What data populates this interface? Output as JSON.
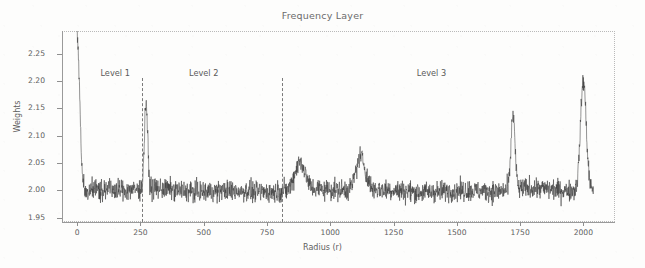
{
  "chart_data": {
    "type": "line",
    "title": "Frequency Layer",
    "xlabel": "Radius (r)",
    "ylabel": "Weights",
    "xlim": [
      -60,
      2125
    ],
    "ylim": [
      1.942,
      2.292
    ],
    "xticks": [
      0,
      250,
      500,
      750,
      1000,
      1250,
      1500,
      1750,
      2000
    ],
    "xtick_labels": [
      "0",
      "250",
      "500",
      "750",
      "1000",
      "1250",
      "1500",
      "1750",
      "2000"
    ],
    "yticks": [
      1.95,
      2.0,
      2.05,
      2.1,
      2.15,
      2.2,
      2.25
    ],
    "ytick_labels": [
      "1.95",
      "2.00",
      "2.05",
      "2.10",
      "2.15",
      "2.20",
      "2.25"
    ],
    "grid": false,
    "legend": false,
    "series_name": "weights",
    "line_color": "#3a3a3a",
    "baseline": 2.0,
    "noise_amplitude": 0.018,
    "peaks": [
      {
        "r": 0,
        "value": 2.28,
        "width": 14,
        "label": "origin-spike"
      },
      {
        "r": 272,
        "value": 2.16,
        "width": 9,
        "label": "level-1-boundary-spike"
      },
      {
        "r": 880,
        "value": 2.05,
        "width": 28,
        "label": "level-2-boundary-bump"
      },
      {
        "r": 1120,
        "value": 2.06,
        "width": 26,
        "label": "mid-bump"
      },
      {
        "r": 1722,
        "value": 2.14,
        "width": 11,
        "label": "level-3-spike"
      },
      {
        "r": 2000,
        "value": 2.2,
        "width": 16,
        "label": "edge-spike"
      }
    ],
    "dividers": [
      {
        "name": "divider-level-1-2",
        "r": 255
      },
      {
        "name": "divider-level-2-3",
        "r": 810
      }
    ],
    "annotations": [
      {
        "name": "level-1",
        "text": "Level 1",
        "r": 150,
        "value": 2.215
      },
      {
        "name": "level-2",
        "text": "Level 2",
        "r": 500,
        "value": 2.215
      },
      {
        "name": "level-3",
        "text": "Level 3",
        "r": 1400,
        "value": 2.215
      }
    ]
  },
  "colors": {
    "line": "#3a3a3a",
    "axis": "#9a9a9a",
    "text": "#5e5e5e",
    "frame": "#b9b9b9",
    "divider": "#7a7a7a",
    "background": "#fdfdfc"
  }
}
